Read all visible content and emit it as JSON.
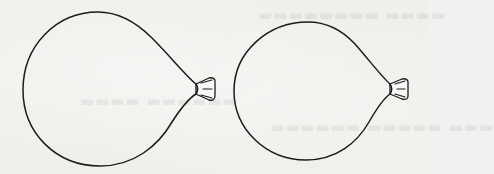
{
  "figure": {
    "background_color": "#efefec",
    "stroke_color": "#1c1c1c",
    "balloons": [
      {
        "id": "balloon-large",
        "label": "",
        "size": "larger",
        "position": "left",
        "knot_side": "right"
      },
      {
        "id": "balloon-small",
        "label": "",
        "size": "smaller",
        "position": "right",
        "knot_side": "right"
      }
    ]
  }
}
